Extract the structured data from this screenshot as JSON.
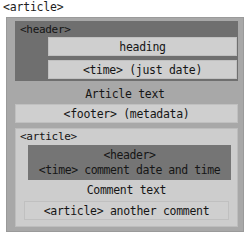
{
  "diagram": {
    "type": "nested-html5-semantic-boxes",
    "outer_label": "<article>",
    "article": {
      "header": {
        "tag_label": "<header>",
        "heading_box": "heading",
        "time_box": "<time> (just date)"
      },
      "body_text": "Article text",
      "footer_box": "<footer> (metadata)",
      "nested_comment": {
        "tag_label": "<article>",
        "comment_header": {
          "line_1": "<header>",
          "line_2": "<time> comment date and time"
        },
        "comment_text": "Comment text",
        "another_comment_box": "<article> another comment"
      }
    },
    "colors": {
      "page_background": "#ffffff",
      "article_outer": "#a8a8a8",
      "header_dark": "#6f6f6f",
      "pale_box": "#cfcfcf",
      "article_nested": "#cdcdcd",
      "comment_header_dark": "#757575",
      "text": "#151515"
    }
  }
}
